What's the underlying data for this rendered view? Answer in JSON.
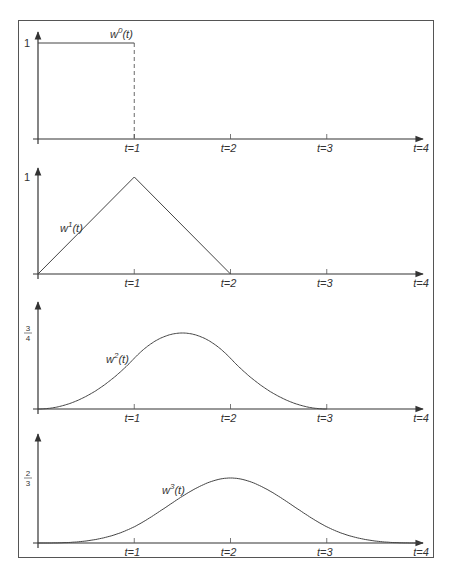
{
  "chart_data": [
    {
      "type": "line",
      "title": "w^0(t)",
      "curve_label": "w0(t)",
      "label_base": "w",
      "label_sup": "0",
      "label_arg": "(t)",
      "xlabel": "t",
      "x_ticks": [
        "t=1",
        "t=2",
        "t=3",
        "t=4"
      ],
      "y_tick_label": "1",
      "y_tick_value": 1,
      "x": [
        0,
        1,
        1
      ],
      "y": [
        1,
        1,
        0
      ],
      "note": "box function; vertical drop at t=1 drawn dashed",
      "xlim": [
        0,
        4
      ],
      "ylim": [
        0,
        1.1
      ]
    },
    {
      "type": "line",
      "title": "w^1(t)",
      "curve_label": "w1(t)",
      "label_base": "w",
      "label_sup": "1",
      "label_arg": "(t)",
      "xlabel": "t",
      "x_ticks": [
        "t=1",
        "t=2",
        "t=3",
        "t=4"
      ],
      "y_tick_label": "1",
      "y_tick_value": 1,
      "x": [
        0,
        1,
        2
      ],
      "y": [
        0,
        1,
        0
      ],
      "xlim": [
        0,
        4
      ],
      "ylim": [
        0,
        1.1
      ]
    },
    {
      "type": "line",
      "title": "w^2(t)",
      "curve_label": "w2(t)",
      "label_base": "w",
      "label_sup": "2",
      "label_arg": "(t)",
      "xlabel": "t",
      "x_ticks": [
        "t=1",
        "t=2",
        "t=3",
        "t=4"
      ],
      "y_tick_label_num": "3",
      "y_tick_label_den": "4",
      "y_tick_value": 0.75,
      "x": [
        0,
        0.5,
        1,
        1.5,
        2,
        2.5,
        3
      ],
      "y": [
        0,
        0.125,
        0.5,
        0.75,
        0.5,
        0.125,
        0
      ],
      "xlim": [
        0,
        4
      ],
      "ylim": [
        0,
        1.0
      ]
    },
    {
      "type": "line",
      "title": "w^3(t)",
      "curve_label": "w3(t)",
      "label_base": "w",
      "label_sup": "3",
      "label_arg": "(t)",
      "xlabel": "t",
      "x_ticks": [
        "t=1",
        "t=2",
        "t=3",
        "t=4"
      ],
      "y_tick_label_num": "2",
      "y_tick_label_den": "3",
      "y_tick_value": 0.6667,
      "x": [
        0,
        0.5,
        1,
        1.5,
        2,
        2.5,
        3,
        3.5,
        4
      ],
      "y": [
        0,
        0.0208,
        0.1667,
        0.4792,
        0.6667,
        0.4792,
        0.1667,
        0.0208,
        0
      ],
      "xlim": [
        0,
        4
      ],
      "ylim": [
        0,
        0.95
      ]
    }
  ],
  "colors": {
    "line": "#444444",
    "frame": "#555555",
    "text": "#333333",
    "background": "#ffffff"
  }
}
